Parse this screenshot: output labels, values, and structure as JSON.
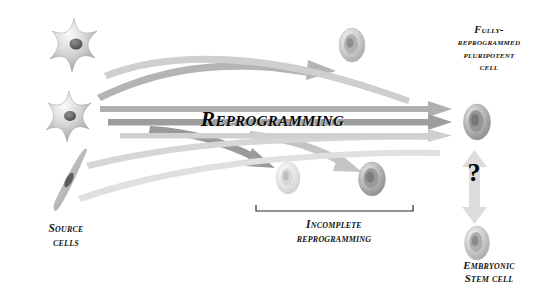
{
  "diagram": {
    "title_text": "Reprogramming",
    "background_color": "#ffffff",
    "labels": {
      "source_cells": "Source\ncells",
      "incomplete_reprogramming": "Incomplete\nreprogramming",
      "fully_reprogrammed": "Fully-\nreprogrammed\npluripotent\ncell",
      "embryonic_stem_cell": "Embryonic\nStem cell",
      "question_mark": "?"
    },
    "colors": {
      "text": "#141414",
      "title_text": "#0a0a0a",
      "arrow_dark": "#8a8a8a",
      "arrow_mid": "#a8a8a8",
      "arrow_light": "#c8c8c8",
      "arrow_pale": "#dcdcdc",
      "cell_body": "#b9b9b9",
      "cell_nucleus": "#595959",
      "bracket": "#2a2a2a"
    },
    "cells": {
      "source": [
        {
          "name": "source-cell-star-top",
          "shape": "stellate",
          "cx": 74,
          "cy": 47
        },
        {
          "name": "source-cell-star-middle",
          "shape": "stellate",
          "cx": 69,
          "cy": 118
        },
        {
          "name": "source-cell-spindle-bottom",
          "shape": "spindle",
          "cx": 66,
          "cy": 182
        }
      ],
      "incomplete": [
        {
          "name": "incomplete-cell-top-right",
          "shape": "round-pale",
          "cx": 352,
          "cy": 45
        },
        {
          "name": "incomplete-cell-lower-left",
          "shape": "round-pale",
          "cx": 288,
          "cy": 178
        },
        {
          "name": "incomplete-cell-lower-right",
          "shape": "round-dark",
          "cx": 372,
          "cy": 179
        }
      ],
      "outcome": [
        {
          "name": "pluripotent-cell",
          "shape": "round-dark",
          "cx": 477,
          "cy": 122
        },
        {
          "name": "embryonic-stem-cell",
          "shape": "round-mid",
          "cx": 477,
          "cy": 243
        }
      ]
    },
    "arrows": {
      "straight_to_pluripotent": [
        {
          "name": "arrow-to-pluripotent-upper",
          "tone": "light"
        },
        {
          "name": "arrow-to-pluripotent-middle",
          "tone": "mid"
        },
        {
          "name": "arrow-to-pluripotent-lower",
          "tone": "pale"
        }
      ],
      "curved": [
        {
          "name": "arrow-curve-up-to-top-cell",
          "tone": "mid"
        },
        {
          "name": "arrow-curve-down-to-incomplete-left",
          "tone": "dark"
        },
        {
          "name": "arrow-curve-down-to-incomplete-right",
          "tone": "light"
        },
        {
          "name": "arrow-curve-sweep-lower",
          "tone": "light"
        }
      ],
      "vertical_double": {
        "name": "double-headed-arrow-question",
        "tone": "pale",
        "x": 474,
        "top": 152,
        "bottom": 222
      }
    },
    "bracket": {
      "name": "incomplete-reprogramming-bracket",
      "x_start": 256,
      "x_end": 413,
      "y": 211
    }
  }
}
